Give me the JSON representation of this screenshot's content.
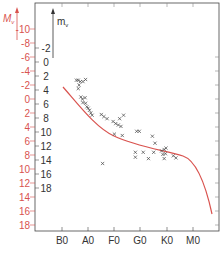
{
  "chart_data": {
    "type": "scatter",
    "title": "",
    "xlabel": "",
    "ylabel_left_outer": "Mv",
    "ylabel_left_inner": "mv",
    "x_categories": [
      "B0",
      "A0",
      "F0",
      "G0",
      "K0",
      "M0"
    ],
    "y_axes": [
      {
        "name": "Mv",
        "color": "#d9534f",
        "ticks": [
          10,
          8,
          6,
          4,
          2,
          0,
          2,
          4,
          6,
          8,
          10,
          12,
          14,
          16,
          18
        ],
        "note": "upper ticks are negative (-10..-2), lower positive"
      },
      {
        "name": "mv",
        "color": "#333333",
        "ticks": [
          -2,
          0,
          2,
          4,
          6,
          8,
          10,
          12,
          14,
          16,
          18
        ]
      }
    ],
    "series": [
      {
        "name": "cluster stars",
        "marker": "x",
        "color": "#333333",
        "points": [
          {
            "x": 0.55,
            "mv": 2.6
          },
          {
            "x": 0.62,
            "mv": 2.6
          },
          {
            "x": 0.7,
            "mv": 2.8
          },
          {
            "x": 0.8,
            "mv": 2.8
          },
          {
            "x": 0.9,
            "mv": 2.5
          },
          {
            "x": 0.65,
            "mv": 3.3
          },
          {
            "x": 0.62,
            "mv": 3.8
          },
          {
            "x": 0.72,
            "mv": 5.0
          },
          {
            "x": 0.78,
            "mv": 5.3
          },
          {
            "x": 0.88,
            "mv": 5.1
          },
          {
            "x": 0.8,
            "mv": 5.8
          },
          {
            "x": 0.9,
            "mv": 5.9
          },
          {
            "x": 0.95,
            "mv": 6.4
          },
          {
            "x": 1.0,
            "mv": 6.6
          },
          {
            "x": 1.05,
            "mv": 6.9
          },
          {
            "x": 1.1,
            "mv": 7.3
          },
          {
            "x": 1.15,
            "mv": 7.6
          },
          {
            "x": 1.5,
            "mv": 7.5
          },
          {
            "x": 1.6,
            "mv": 7.8
          },
          {
            "x": 1.72,
            "mv": 8.1
          },
          {
            "x": 1.95,
            "mv": 8.5
          },
          {
            "x": 2.05,
            "mv": 8.8
          },
          {
            "x": 2.15,
            "mv": 9.0
          },
          {
            "x": 2.2,
            "mv": 8.1
          },
          {
            "x": 2.35,
            "mv": 7.6
          },
          {
            "x": 2.25,
            "mv": 9.2
          },
          {
            "x": 2.0,
            "mv": 10.3
          },
          {
            "x": 2.3,
            "mv": 10.5
          },
          {
            "x": 2.85,
            "mv": 9.9
          },
          {
            "x": 2.95,
            "mv": 9.9
          },
          {
            "x": 3.45,
            "mv": 10.6
          },
          {
            "x": 3.55,
            "mv": 11.6
          },
          {
            "x": 2.8,
            "mv": 12.9
          },
          {
            "x": 3.1,
            "mv": 12.9
          },
          {
            "x": 3.5,
            "mv": 12.9
          },
          {
            "x": 2.8,
            "mv": 13.6
          },
          {
            "x": 3.3,
            "mv": 13.8
          },
          {
            "x": 3.9,
            "mv": 13.8
          },
          {
            "x": 3.8,
            "mv": 12.7
          },
          {
            "x": 3.9,
            "mv": 12.5
          },
          {
            "x": 3.97,
            "mv": 12.3
          },
          {
            "x": 3.85,
            "mv": 13.2
          },
          {
            "x": 3.95,
            "mv": 13.1
          },
          {
            "x": 4.25,
            "mv": 13.4
          },
          {
            "x": 4.35,
            "mv": 13.7
          },
          {
            "x": 1.55,
            "mv": 14.5
          }
        ]
      }
    ],
    "curve": {
      "name": "main sequence",
      "color": "#d9534f",
      "points": [
        {
          "x": -0.6,
          "Mv": -2.0
        },
        {
          "x": 0.0,
          "Mv": 0.5
        },
        {
          "x": 0.5,
          "Mv": 2.2
        },
        {
          "x": 1.0,
          "Mv": 3.5
        },
        {
          "x": 1.5,
          "Mv": 4.4
        },
        {
          "x": 2.0,
          "Mv": 5.0
        },
        {
          "x": 2.5,
          "Mv": 5.5
        },
        {
          "x": 3.0,
          "Mv": 6.1
        },
        {
          "x": 3.5,
          "Mv": 6.7
        },
        {
          "x": 4.0,
          "Mv": 7.4
        },
        {
          "x": 4.5,
          "Mv": 8.7
        },
        {
          "x": 4.9,
          "Mv": 11.5
        },
        {
          "x": 5.3,
          "Mv": 16.5
        }
      ]
    },
    "grid": false,
    "legend": null
  },
  "axes": {
    "Mv_label": "M",
    "Mv_sub": "v",
    "mv_label": "m",
    "mv_sub": "v",
    "Mv_ticks": [
      "10",
      "8",
      "6",
      "4",
      "2",
      "0",
      "2",
      "4",
      "6",
      "8",
      "10",
      "12",
      "14",
      "16",
      "18"
    ],
    "mv_ticks": [
      "2",
      "0",
      "2",
      "4",
      "6",
      "8",
      "10",
      "12",
      "14",
      "16",
      "18"
    ],
    "x_ticks": [
      "B0",
      "A0",
      "F0",
      "G0",
      "K0",
      "M0"
    ]
  }
}
